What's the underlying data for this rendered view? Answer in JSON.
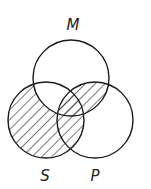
{
  "diagram": {
    "type": "venn-3",
    "stroke_color": "#1a1a1a",
    "hatch_color": "#333333",
    "background": "#ffffff",
    "circles": [
      {
        "id": "M",
        "label": "M",
        "cx": 71,
        "cy": 78,
        "r": 38,
        "label_x": 73,
        "label_y": 30
      },
      {
        "id": "S",
        "label": "S",
        "cx": 46,
        "cy": 120,
        "r": 38,
        "label_x": 45,
        "label_y": 181
      },
      {
        "id": "P",
        "label": "P",
        "cx": 95,
        "cy": 120,
        "r": 38,
        "label_x": 95,
        "label_y": 181
      }
    ],
    "shaded_regions": [
      "S only",
      "S∩P only",
      "M∩P only",
      "S∩M∩P"
    ],
    "unshaded_regions": [
      "M only",
      "P only",
      "S∩M only"
    ]
  }
}
